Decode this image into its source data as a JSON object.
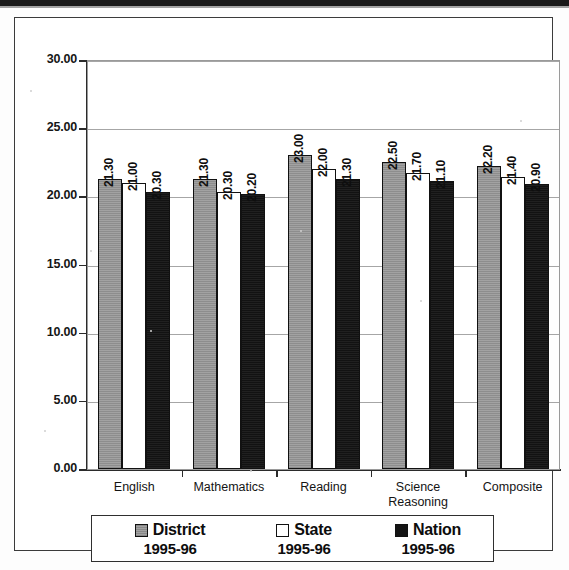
{
  "chart_data": {
    "type": "bar",
    "title": "",
    "xlabel": "",
    "ylabel": "",
    "ylim": [
      0,
      30
    ],
    "ytick_step": 5,
    "grid": true,
    "legend_position": "bottom",
    "categories": [
      "English",
      "Mathematics",
      "Reading",
      "Science Reasoning",
      "Composite"
    ],
    "ytick_labels": [
      "30.00",
      "25.00",
      "20.00",
      "15.00",
      "10.00",
      "5.00",
      "0.00"
    ],
    "ytick_values": [
      30,
      25,
      20,
      15,
      10,
      5,
      0
    ],
    "series": [
      {
        "name": "District",
        "year": "1995-96",
        "color": "#9d9d9d",
        "values": [
          21.3,
          21.3,
          23.0,
          22.5,
          22.2
        ],
        "labels": [
          "21.30",
          "21.30",
          "23.00",
          "22.50",
          "22.20"
        ]
      },
      {
        "name": "State",
        "year": "1995-96",
        "color": "#ffffff",
        "values": [
          21.0,
          20.3,
          22.0,
          21.7,
          21.4
        ],
        "labels": [
          "21.00",
          "20.30",
          "22.00",
          "21.70",
          "21.40"
        ]
      },
      {
        "name": "Nation",
        "year": "1995-96",
        "color": "#141414",
        "values": [
          20.3,
          20.2,
          21.3,
          21.1,
          20.9
        ],
        "labels": [
          "20.30",
          "20.20",
          "21.30",
          "21.10",
          "20.90"
        ]
      }
    ]
  },
  "legend": {
    "items": [
      {
        "name": "District",
        "year": "1995-96",
        "swatch": "district"
      },
      {
        "name": "State",
        "year": "1995-96",
        "swatch": "state"
      },
      {
        "name": "Nation",
        "year": "1995-96",
        "swatch": "nation"
      }
    ]
  },
  "axis": {
    "categories": [
      {
        "line1": "English",
        "line2": ""
      },
      {
        "line1": "Mathematics",
        "line2": ""
      },
      {
        "line1": "Reading",
        "line2": ""
      },
      {
        "line1": "Science",
        "line2": "Reasoning"
      },
      {
        "line1": "Composite",
        "line2": ""
      }
    ]
  }
}
